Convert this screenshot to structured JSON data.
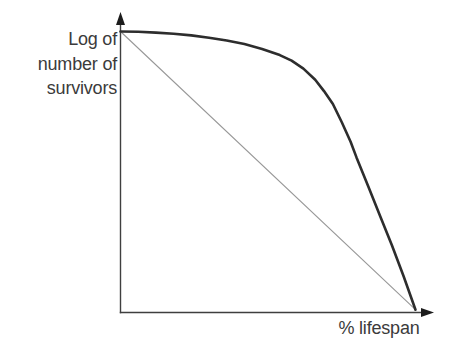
{
  "labels": {
    "y_lines": [
      "Log of",
      "number of",
      "survivors"
    ],
    "x": "% lifespan"
  },
  "colors": {
    "axis": "#3f3f3f",
    "arrow": "#1c1c1c",
    "text": "#3b3b3b",
    "curve": "#2d2d2d",
    "reference": "#989898",
    "background": "#ffffff"
  },
  "chart_data": {
    "type": "line",
    "title": "",
    "xlabel": "% lifespan",
    "ylabel": "Log of number of survivors",
    "xlim": [
      0,
      100
    ],
    "ylim": [
      0,
      1
    ],
    "grid": false,
    "ticks": "none (conceptual graph, arrow-tipped axes, no tick marks or numeric scale)",
    "legend": "none",
    "series": [
      {
        "id": "reference-line",
        "description": "thin straight diagonal reference line (constant proportional mortality, Type II)",
        "color": "#989898",
        "stroke_width": 1.1,
        "points": [
          [
            0,
            1.0
          ],
          [
            100,
            0.01
          ]
        ]
      },
      {
        "id": "survivorship-curve",
        "description": "thick Type I survivorship curve: log of survivors stays high for most of lifespan, then drops steeply near end of life",
        "color": "#2d2d2d",
        "stroke_width": 2.6,
        "points": [
          [
            0,
            1.0
          ],
          [
            6,
            0.999
          ],
          [
            12,
            0.996
          ],
          [
            18,
            0.992
          ],
          [
            24,
            0.986
          ],
          [
            30,
            0.978
          ],
          [
            36,
            0.968
          ],
          [
            42,
            0.955
          ],
          [
            48,
            0.938
          ],
          [
            54,
            0.916
          ],
          [
            58,
            0.896
          ],
          [
            62,
            0.868
          ],
          [
            66,
            0.828
          ],
          [
            69,
            0.788
          ],
          [
            72,
            0.742
          ],
          [
            75,
            0.677
          ],
          [
            78,
            0.608
          ],
          [
            80,
            0.552
          ],
          [
            84,
            0.448
          ],
          [
            88,
            0.343
          ],
          [
            92,
            0.239
          ],
          [
            96,
            0.128
          ],
          [
            100,
            0.01
          ]
        ]
      }
    ]
  }
}
